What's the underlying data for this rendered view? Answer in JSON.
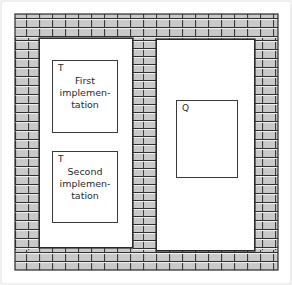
{
  "figure": {
    "wall_fill_color": "#c9c9c9",
    "wall_line_color": "#2b2b2b",
    "mortar_highlight_color": "#f2f2f2",
    "background_color": "#ffffff",
    "outline_color": "#2b2b2b"
  },
  "rooms": [
    {
      "name": "left-room"
    },
    {
      "name": "right-room"
    }
  ],
  "boxes": [
    {
      "id": "first",
      "tag": "T",
      "lines": [
        "First",
        "implemen-",
        "tation"
      ]
    },
    {
      "id": "second",
      "tag": "T",
      "lines": [
        "Second",
        "implemen-",
        "tation"
      ]
    },
    {
      "id": "q",
      "tag": "Q",
      "lines": []
    }
  ]
}
